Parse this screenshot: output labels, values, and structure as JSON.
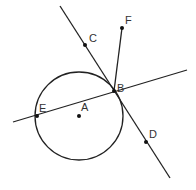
{
  "diagram": {
    "type": "geometry",
    "colors": {
      "stroke": "#222222",
      "point": "#111111",
      "label": "#333333",
      "background": "#ffffff"
    },
    "circle": {
      "name": "circle-A",
      "center": "A",
      "cx": 79,
      "cy": 116,
      "r": 44
    },
    "points": [
      {
        "id": "A",
        "label": "A",
        "x": 79,
        "y": 116,
        "lx": 81,
        "ly": 111
      },
      {
        "id": "B",
        "label": "B",
        "x": 114,
        "y": 91,
        "lx": 117,
        "ly": 92
      },
      {
        "id": "C",
        "label": "C",
        "x": 85,
        "y": 45,
        "lx": 89,
        "ly": 42
      },
      {
        "id": "D",
        "label": "D",
        "x": 146,
        "y": 142,
        "lx": 149,
        "ly": 138
      },
      {
        "id": "E",
        "label": "E",
        "x": 37,
        "y": 116,
        "lx": 39,
        "ly": 112
      },
      {
        "id": "F",
        "label": "F",
        "x": 122,
        "y": 28,
        "lx": 125,
        "ly": 24
      }
    ],
    "lines": [
      {
        "name": "line-CD-tangent",
        "x1": 60,
        "y1": 6,
        "x2": 170,
        "y2": 178
      },
      {
        "name": "line-EB-secant",
        "x1": 13,
        "y1": 122,
        "x2": 187,
        "y2": 70
      },
      {
        "name": "segment-BF",
        "x1": 114,
        "y1": 91,
        "x2": 122,
        "y2": 28
      }
    ]
  }
}
